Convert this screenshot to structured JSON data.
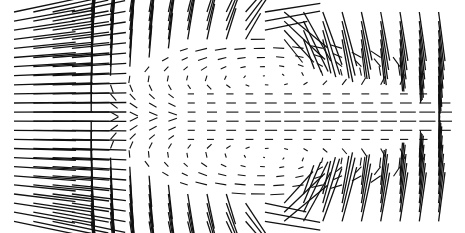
{
  "chart_data": {
    "type": "quiver",
    "title": "",
    "xlabel": "",
    "ylabel": "",
    "grid": false,
    "legend": null,
    "arrowheads": false,
    "sampling": {
      "columns": 23,
      "rows": 24,
      "x0_px": 14,
      "dx_px": 19.3,
      "y0_px": 12,
      "dy_px": 9.1
    },
    "plot_extent_px": {
      "left": 14,
      "right": 452,
      "top": 10,
      "bottom": 223
    },
    "field_model": {
      "bubble_center_px": [
        268,
        117
      ],
      "bubble_half_axes_px": [
        175,
        78
      ],
      "inlet_end_x_px": 85,
      "outer_speed": 1.0,
      "inner_recirculation_speed": 0.45,
      "max_segment_px": 70,
      "min_segment_px": 1.2
    },
    "regions": [
      {
        "name": "inlet",
        "x_range_px": [
          14,
          85
        ],
        "direction": "horizontal, rightward",
        "relative_speed": "high"
      },
      {
        "name": "upper-shear-layer",
        "y_range_px": [
          10,
          50
        ],
        "direction": "up-right then flattening",
        "relative_speed": "high"
      },
      {
        "name": "lower-shear-layer",
        "y_range_px": [
          180,
          223
        ],
        "direction": "down-right then flattening",
        "relative_speed": "high"
      },
      {
        "name": "recirculation-bubble",
        "center_px": [
          268,
          117
        ],
        "direction": "closed elliptical circulation, near-zero at centers",
        "relative_speed": "low"
      },
      {
        "name": "outlet",
        "x_range_px": [
          380,
          452
        ],
        "direction": "horizontal",
        "relative_speed": "medium"
      }
    ],
    "stroke_color": "#111111",
    "background_color": "#ffffff"
  }
}
